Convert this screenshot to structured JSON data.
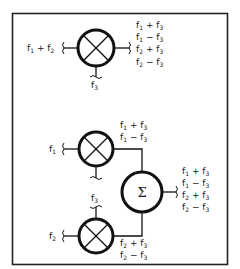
{
  "diagram": {
    "frame": {
      "border_color": "#222222",
      "background": "#ffffff"
    },
    "top_mixer": {
      "symbol": "mixer-x-circle",
      "input_left": {
        "base": "f",
        "sub": "1",
        "op": "+",
        "base2": "f",
        "sub2": "2"
      },
      "input_bottom": {
        "base": "f",
        "sub": "3"
      },
      "outputs": [
        {
          "a": "f",
          "as": "1",
          "op": "+",
          "b": "f",
          "bs": "3"
        },
        {
          "a": "f",
          "as": "1",
          "op": "−",
          "b": "f",
          "bs": "3"
        },
        {
          "a": "f",
          "as": "2",
          "op": "+",
          "b": "f",
          "bs": "3"
        },
        {
          "a": "f",
          "as": "2",
          "op": "−",
          "b": "f",
          "bs": "3"
        }
      ]
    },
    "mixer_1": {
      "symbol": "mixer-x-circle",
      "input_left": {
        "base": "f",
        "sub": "1"
      },
      "outputs": [
        {
          "a": "f",
          "as": "1",
          "op": "+",
          "b": "f",
          "bs": "3"
        },
        {
          "a": "f",
          "as": "1",
          "op": "−",
          "b": "f",
          "bs": "3"
        }
      ]
    },
    "mixer_2": {
      "symbol": "mixer-x-circle",
      "input_left": {
        "base": "f",
        "sub": "2"
      },
      "input_top": {
        "base": "f",
        "sub": "3"
      },
      "outputs": [
        {
          "a": "f",
          "as": "2",
          "op": "+",
          "b": "f",
          "bs": "3"
        },
        {
          "a": "f",
          "as": "2",
          "op": "−",
          "b": "f",
          "bs": "3"
        }
      ]
    },
    "summer": {
      "symbol": "Σ",
      "outputs": [
        {
          "a": "f",
          "as": "1",
          "op": "+",
          "b": "f",
          "bs": "3"
        },
        {
          "a": "f",
          "as": "1",
          "op": "−",
          "b": "f",
          "bs": "3"
        },
        {
          "a": "f",
          "as": "2",
          "op": "+",
          "b": "f",
          "bs": "3"
        },
        {
          "a": "f",
          "as": "2",
          "op": "−",
          "b": "f",
          "bs": "3"
        }
      ]
    }
  }
}
